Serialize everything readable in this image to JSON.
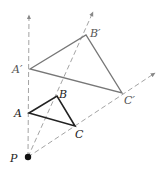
{
  "diagram": {
    "type": "dilation",
    "center": {
      "label": "P",
      "x": 28,
      "y": 157
    },
    "original_triangle": {
      "color": "#222222",
      "vertices": [
        {
          "label": "A",
          "x": 29,
          "y": 113
        },
        {
          "label": "B",
          "x": 57,
          "y": 96
        },
        {
          "label": "C",
          "x": 75,
          "y": 126
        }
      ]
    },
    "image_triangle": {
      "color": "#777777",
      "vertices": [
        {
          "label": "A'",
          "x": 30,
          "y": 69
        },
        {
          "label": "B'",
          "x": 86,
          "y": 35
        },
        {
          "label": "C'",
          "x": 122,
          "y": 93
        }
      ]
    },
    "rays": [
      {
        "name": "ray-through-A",
        "tip_x": 29,
        "tip_y": 15
      },
      {
        "name": "ray-through-B",
        "tip_x": 93,
        "tip_y": 12
      },
      {
        "name": "ray-through-C",
        "tip_x": 155,
        "tip_y": 73
      }
    ],
    "labels": {
      "P": "P",
      "A": "A",
      "B": "B",
      "C": "C",
      "A_prime": "A′",
      "B_prime": "B′",
      "C_prime": "C′"
    }
  }
}
